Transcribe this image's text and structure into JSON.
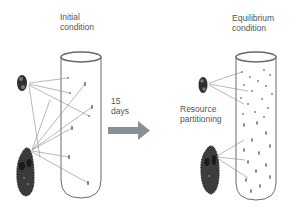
{
  "left_panel": {
    "title_line1": "Initial",
    "title_line2": "condition"
  },
  "arrow": {
    "line1": "15",
    "line2": "days",
    "color": "#8a8f95"
  },
  "right_panel": {
    "title_line1": "Equilibrium",
    "title_line2": "condition",
    "annotation_line1": "Resource",
    "annotation_line2": "partitioning"
  },
  "colors": {
    "tube_outline": "#6a6a6a",
    "line": "#8a8a8a",
    "organism": "#3a3a3a"
  }
}
